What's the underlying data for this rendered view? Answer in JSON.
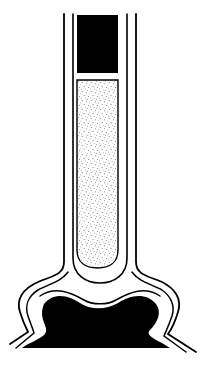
{
  "diagram": {
    "title": "Tube in sheath with base reservoir (line drawing)",
    "colors": {
      "background": "#ffffff",
      "ink": "#000000",
      "stipple": "#6a6a6a"
    },
    "parts": [
      {
        "id": "outer-sheath",
        "label": "outer sheath"
      },
      {
        "id": "inner-sheath",
        "label": "inner sheath"
      },
      {
        "id": "solid-plug",
        "label": "solid plug"
      },
      {
        "id": "stippled-tube",
        "label": "stippled tube"
      },
      {
        "id": "base-mass",
        "label": "base mass"
      }
    ]
  }
}
